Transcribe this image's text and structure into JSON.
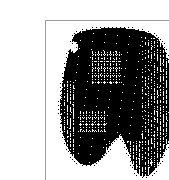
{
  "page": {
    "background_color": "#ffffff",
    "width": 169,
    "height": 180
  },
  "figure": {
    "frame": {
      "x": 5,
      "y": 4,
      "width": 156,
      "height": 167,
      "border_color": "#9a9a9a",
      "border_width": 1,
      "fill_color": "#ffffff"
    },
    "caption": "",
    "title": "",
    "alt_text": "Halftoned black-and-white scanned silhouette with two rounded lobes meeting at a central notch",
    "ink_color": "#000000",
    "paper_color": "#ffffff",
    "rendering": "bitonal-halftone"
  },
  "chart_data": {
    "type": "heatmap",
    "title": "",
    "subtitle": "",
    "xlabel": "",
    "ylabel": "",
    "grid": false,
    "legend": null,
    "colormap": [
      "#ffffff",
      "#000000"
    ],
    "xlim": [
      0,
      154
    ],
    "ylim": [
      0,
      165
    ],
    "shape_outline": [
      [
        28,
        14
      ],
      [
        36,
        10
      ],
      [
        48,
        8
      ],
      [
        62,
        7
      ],
      [
        78,
        7
      ],
      [
        92,
        9
      ],
      [
        104,
        12
      ],
      [
        112,
        17
      ],
      [
        118,
        26
      ],
      [
        122,
        38
      ],
      [
        124,
        52
      ],
      [
        126,
        66
      ],
      [
        128,
        80
      ],
      [
        128,
        94
      ],
      [
        126,
        108
      ],
      [
        122,
        122
      ],
      [
        117,
        134
      ],
      [
        112,
        144
      ],
      [
        106,
        152
      ],
      [
        100,
        156
      ],
      [
        94,
        155
      ],
      [
        88,
        148
      ],
      [
        84,
        138
      ],
      [
        80,
        128
      ],
      [
        76,
        120
      ],
      [
        72,
        116
      ],
      [
        67,
        120
      ],
      [
        62,
        128
      ],
      [
        57,
        136
      ],
      [
        50,
        142
      ],
      [
        42,
        145
      ],
      [
        34,
        143
      ],
      [
        27,
        136
      ],
      [
        21,
        126
      ],
      [
        17,
        114
      ],
      [
        15,
        100
      ],
      [
        14,
        86
      ],
      [
        15,
        72
      ],
      [
        17,
        58
      ],
      [
        20,
        44
      ],
      [
        23,
        30
      ],
      [
        28,
        14
      ]
    ],
    "lobes": [
      {
        "name": "left-lobe",
        "centroid": [
          52,
          78
        ],
        "width": 74,
        "height": 130,
        "ink_density": 0.93
      },
      {
        "name": "right-lobe",
        "centroid": [
          100,
          82
        ],
        "width": 58,
        "height": 140,
        "ink_density": 0.95
      }
    ],
    "notch": {
      "name": "central-cleft",
      "apex": [
        74,
        112
      ],
      "base_left": [
        62,
        152
      ],
      "base_right": [
        92,
        150
      ],
      "depth": 42
    },
    "texture_patches": [
      {
        "name": "upper-left-crosshatch",
        "x": 46,
        "y": 30,
        "width": 30,
        "height": 34,
        "density": 0.55,
        "pattern": "crosshatch"
      },
      {
        "name": "mid-left-crosshatch",
        "x": 32,
        "y": 90,
        "width": 28,
        "height": 22,
        "density": 0.45,
        "pattern": "crosshatch"
      },
      {
        "name": "right-edge-striping",
        "x": 96,
        "y": 16,
        "width": 30,
        "height": 130,
        "density": 0.8,
        "pattern": "vertical-stripe"
      },
      {
        "name": "left-edge-striping",
        "x": 14,
        "y": 60,
        "width": 16,
        "height": 80,
        "density": 0.7,
        "pattern": "vertical-stripe"
      },
      {
        "name": "lower-center-striping",
        "x": 60,
        "y": 120,
        "width": 44,
        "height": 36,
        "density": 0.72,
        "pattern": "vertical-stripe"
      }
    ],
    "highlights": [
      {
        "name": "upper-left-notch-highlight",
        "x": 24,
        "y": 20,
        "width": 8,
        "height": 12
      },
      {
        "name": "bottom-right-speck",
        "x": 104,
        "y": 140,
        "width": 3,
        "height": 3
      }
    ],
    "statistics": {
      "ink_coverage_percent": 41,
      "bounding_box": [
        14,
        7,
        114,
        157
      ],
      "levels": 2
    }
  }
}
